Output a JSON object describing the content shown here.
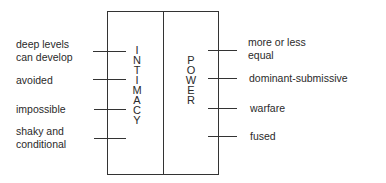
{
  "diagram": {
    "left_axis": {
      "title": "INTIMACY",
      "letters": [
        "I",
        "N",
        "T",
        "I",
        "M",
        "A",
        "C",
        "Y"
      ],
      "labels": [
        {
          "line1": "deep levels",
          "line2": "can develop"
        },
        {
          "line1": "avoided",
          "line2": ""
        },
        {
          "line1": "impossible",
          "line2": ""
        },
        {
          "line1": "shaky and",
          "line2": "conditional"
        }
      ]
    },
    "right_axis": {
      "title": "POWER",
      "letters": [
        "P",
        "O",
        "W",
        "E",
        "R"
      ],
      "labels": [
        {
          "line1": "more or less",
          "line2": "equal"
        },
        {
          "line1": "dominant-submissive",
          "line2": ""
        },
        {
          "line1": "warfare",
          "line2": ""
        },
        {
          "line1": "fused",
          "line2": ""
        }
      ]
    }
  }
}
